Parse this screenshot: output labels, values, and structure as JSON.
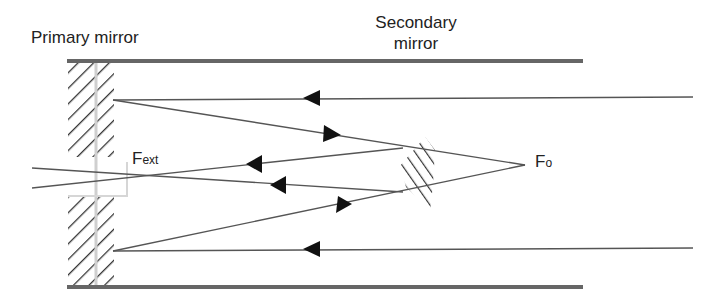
{
  "diagram": {
    "labels": {
      "primary_mirror": "Primary mirror",
      "secondary_mirror_line1": "Secondary",
      "secondary_mirror_line2": "mirror",
      "f_ext_main": "F",
      "f_ext_sub": "ext",
      "f_o_main": "F",
      "f_o_sub": "o"
    },
    "colors": {
      "line": "#555555",
      "tube": "#666666",
      "hatch": "#333333",
      "arrow": "#111111",
      "guide": "#cccccc"
    },
    "elements": [
      {
        "id": "tube-top",
        "type": "tube-wall",
        "x1": 67,
        "x2": 583,
        "y": 61
      },
      {
        "id": "tube-bottom",
        "type": "tube-wall",
        "x1": 67,
        "x2": 583,
        "y": 287
      },
      {
        "id": "primary-mirror-top",
        "type": "hatched-mirror",
        "x": 67,
        "y": 62,
        "w": 48,
        "h": 95
      },
      {
        "id": "primary-mirror-bottom",
        "type": "hatched-mirror",
        "x": 67,
        "y": 196,
        "w": 48,
        "h": 90
      },
      {
        "id": "secondary-mirror",
        "type": "hatched-mirror",
        "cx": 417,
        "cy": 175
      },
      {
        "id": "ray-in-top",
        "type": "ray",
        "from": [
          693,
          97
        ],
        "to": [
          113,
          100
        ],
        "arrow_dir": "left"
      },
      {
        "id": "ray-in-bottom",
        "type": "ray",
        "from": [
          693,
          248
        ],
        "to": [
          113,
          251
        ],
        "arrow_dir": "left"
      },
      {
        "id": "ray-top-to-fo",
        "type": "ray",
        "from": [
          113,
          100
        ],
        "to": [
          525,
          165
        ],
        "arrow_dir": "right"
      },
      {
        "id": "ray-bottom-to-fo",
        "type": "ray",
        "from": [
          113,
          251
        ],
        "to": [
          525,
          165
        ],
        "arrow_dir": "right"
      },
      {
        "id": "ray-reflect-upper",
        "type": "ray",
        "from": [
          402,
          148
        ],
        "to": [
          32,
          188
        ],
        "arrow_dir": "left"
      },
      {
        "id": "ray-reflect-lower",
        "type": "ray",
        "from": [
          402,
          191
        ],
        "to": [
          32,
          168
        ],
        "arrow_dir": "left"
      }
    ]
  }
}
